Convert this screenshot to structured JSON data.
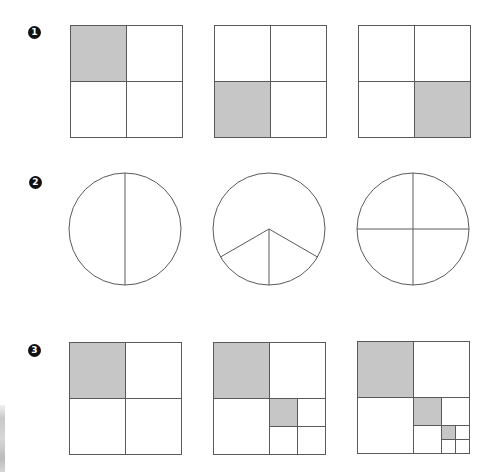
{
  "colors": {
    "stroke": "#5a5a5a",
    "shade": "#c6c6c6",
    "background": "#ffffff",
    "label_bg": "#111111",
    "label_fg": "#ffffff"
  },
  "rows": [
    {
      "label": "1",
      "label_pos": [
        34,
        32
      ],
      "figures": [
        {
          "type": "square-quarters",
          "x": 70,
          "y": 25,
          "size": 112,
          "shaded": [
            "top-left"
          ]
        },
        {
          "type": "square-quarters",
          "x": 214,
          "y": 25,
          "size": 112,
          "shaded": [
            "bottom-left"
          ]
        },
        {
          "type": "square-quarters",
          "x": 358,
          "y": 25,
          "size": 112,
          "shaded": [
            "bottom-right"
          ]
        }
      ]
    },
    {
      "label": "2",
      "label_pos": [
        35,
        182
      ],
      "figures": [
        {
          "type": "circle-divided",
          "cx": 125,
          "cy": 229,
          "r": 56,
          "parts": 2
        },
        {
          "type": "circle-divided",
          "cx": 269,
          "cy": 229,
          "r": 56,
          "parts": 3
        },
        {
          "type": "circle-divided",
          "cx": 413,
          "cy": 229,
          "r": 56,
          "parts": 4
        }
      ]
    },
    {
      "label": "3",
      "label_pos": [
        34,
        350
      ],
      "figures": [
        {
          "type": "square-recursive",
          "x": 69,
          "y": 342,
          "size": 112,
          "levels": 1
        },
        {
          "type": "square-recursive",
          "x": 213,
          "y": 342,
          "size": 112,
          "levels": 2
        },
        {
          "type": "square-recursive",
          "x": 357,
          "y": 341,
          "size": 112,
          "levels": 3
        }
      ]
    }
  ]
}
